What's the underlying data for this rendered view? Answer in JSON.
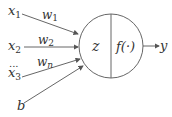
{
  "diagram": {
    "inputs": [
      {
        "label": "x",
        "sub": "1",
        "weight": "w",
        "weight_sub": "1"
      },
      {
        "label": "x",
        "sub": "2",
        "weight": "w",
        "weight_sub": "2"
      },
      {
        "label": "x",
        "sub": "3",
        "weight": "w",
        "weight_sub": "n"
      }
    ],
    "ellipsis": "...",
    "bias": "b",
    "sum_label": "z",
    "activation_label": "f(·)",
    "output_label": "y",
    "colors": {
      "stroke": "#555555",
      "text": "#333333",
      "background": "#ffffff"
    }
  }
}
